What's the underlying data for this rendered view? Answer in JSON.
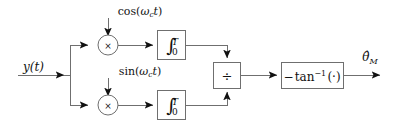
{
  "diagram": {
    "colors": {
      "wire": "#6f6f6f",
      "arrow": "#111111",
      "text": "#111111",
      "background": "#ffffff"
    },
    "input": {
      "label": "y(t)",
      "name": "received-signal"
    },
    "output": {
      "label_base": "θ̂",
      "label_sub": "M",
      "name": "phase-estimate"
    },
    "carriers": {
      "cosine": {
        "fn": "cos",
        "open": "(",
        "omega": "ω",
        "sub": "c",
        "time": "t",
        "close": ")"
      },
      "sine": {
        "fn": "sin",
        "open": "(",
        "omega": "ω",
        "sub": "c",
        "time": "t",
        "close": ")"
      }
    },
    "blocks": {
      "multiplier_symbol": "×",
      "integral_glyph": "∫",
      "integral_upper": "T",
      "integral_lower": "0",
      "divider_symbol": "÷",
      "arctan_minus": "−",
      "arctan_fn": "tan",
      "arctan_sup": "−1",
      "arctan_arg": "(·)"
    },
    "branches": [
      {
        "name": "in-phase-branch",
        "carrier": "cosine"
      },
      {
        "name": "quadrature-branch",
        "carrier": "sine"
      }
    ]
  }
}
